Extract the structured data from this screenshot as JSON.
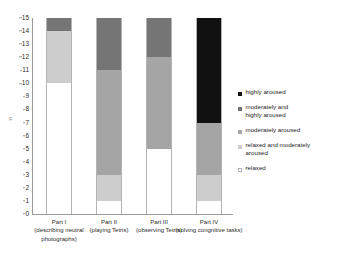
{
  "chart_data": {
    "type": "bar",
    "stacked": true,
    "title": "",
    "subtitle": "",
    "xlabel": "",
    "ylabel": "F",
    "ylim": [
      0,
      15
    ],
    "ytick_values": [
      0,
      1,
      2,
      3,
      4,
      5,
      6,
      7,
      8,
      9,
      10,
      11,
      12,
      13,
      14,
      15
    ],
    "ytick_labels": [
      "0",
      "1",
      "2",
      "3",
      "4",
      "5",
      "6",
      "7",
      "8",
      "9",
      "10",
      "11",
      "12",
      "13",
      "14",
      "15"
    ],
    "grid": false,
    "legend_position": "right",
    "categories": [
      {
        "name": "Part I",
        "description": "(describing neutral photographs)"
      },
      {
        "name": "Part II",
        "description": "(playing Tetris)"
      },
      {
        "name": "Part III",
        "description": "(observing Tetris)"
      },
      {
        "name": "Part IV",
        "description": "(solving congnitive tasks)"
      }
    ],
    "series": [
      {
        "name": "relaxed",
        "color": "#ffffff",
        "values": [
          10,
          1,
          5,
          1
        ]
      },
      {
        "name": "relaxed and moderately aroused",
        "color": "#cdcdcd",
        "values": [
          4,
          2,
          0,
          2
        ]
      },
      {
        "name": "moderately aroused",
        "color": "#a5a5a5",
        "values": [
          0,
          8,
          7,
          4
        ]
      },
      {
        "name": "moderately and highly aroused",
        "color": "#757575",
        "values": [
          1,
          4,
          3,
          0
        ]
      },
      {
        "name": "highly aroused",
        "color": "#111111",
        "values": [
          0,
          0,
          0,
          8
        ]
      }
    ],
    "legend_entries": [
      {
        "label": "highly aroused",
        "color": "#111111"
      },
      {
        "label": "moderately and\nhighly aroused",
        "color": "#757575"
      },
      {
        "label": "moderately aroused",
        "color": "#a5a5a5"
      },
      {
        "label": "relaxed and moderately\naroused",
        "color": "#cdcdcd"
      },
      {
        "label": "relaxed",
        "color": "#ffffff"
      }
    ]
  }
}
